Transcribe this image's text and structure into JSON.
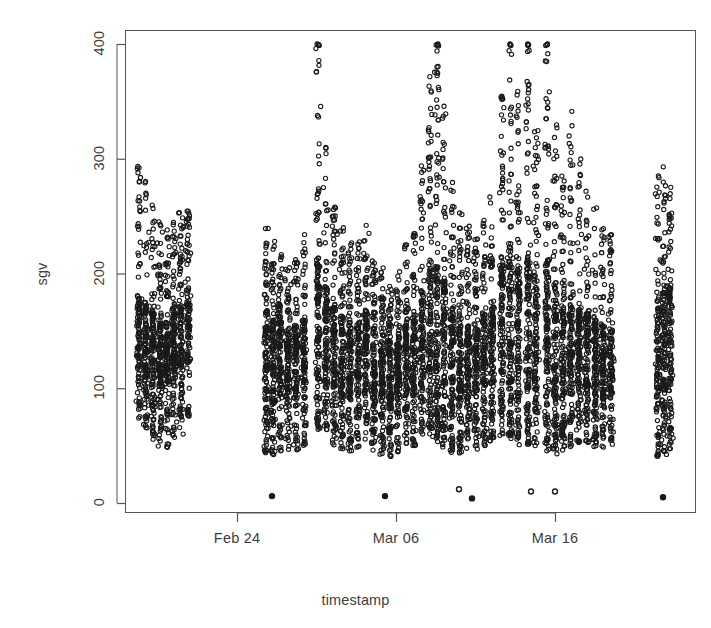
{
  "figure": {
    "background": "#ffffff",
    "ink_color": "#1a1a1a",
    "axis_color": "#555555",
    "point_symbol": "open-circle",
    "point_radius_px": 2.1,
    "point_stroke_px": 1.1
  },
  "axes": {
    "x_title": "timestamp",
    "y_title": "sgv",
    "x_ticks": [
      {
        "label": "Feb 24",
        "px": 237
      },
      {
        "label": "Mar 06",
        "px": 396
      },
      {
        "label": "Mar 16",
        "px": 555
      }
    ],
    "y_ticks": [
      {
        "label": "0",
        "value": 0
      },
      {
        "label": "100",
        "value": 100
      },
      {
        "label": "200",
        "value": 200
      },
      {
        "label": "300",
        "value": 300
      },
      {
        "label": "400",
        "value": 400
      }
    ],
    "plot_box_px": {
      "left": 125,
      "top": 30,
      "right": 695,
      "bottom": 512
    },
    "y_axis_px": {
      "v0": 503,
      "v400": 44
    },
    "box_drawn": true,
    "ticks_outward": true
  },
  "chart_data": {
    "type": "scatter",
    "title": "",
    "xlabel": "timestamp",
    "ylabel": "sgv",
    "ylim": [
      -12,
      412
    ],
    "xlim_days": [
      18.3,
      37.5
    ],
    "x_unit": "days since Feb 1 (Feb 24 = day 24, Mar 06 = day 34, Mar 16 = day 44 offset-mapped to pixels)",
    "grid": false,
    "legend": null,
    "value_ceiling": 400,
    "day_columns": [
      {
        "x_px": 139,
        "low": 72,
        "high": 300,
        "density": 120,
        "core_low": 118,
        "core_high": 182
      },
      {
        "x_px": 146,
        "low": 62,
        "high": 288,
        "density": 128,
        "core_low": 110,
        "core_high": 175
      },
      {
        "x_px": 153,
        "low": 55,
        "high": 262,
        "density": 130,
        "core_low": 105,
        "core_high": 168
      },
      {
        "x_px": 160,
        "low": 48,
        "high": 245,
        "density": 132,
        "core_low": 100,
        "core_high": 160
      },
      {
        "x_px": 167,
        "low": 45,
        "high": 238,
        "density": 126,
        "core_low": 104,
        "core_high": 158
      },
      {
        "x_px": 174,
        "low": 52,
        "high": 255,
        "density": 130,
        "core_low": 112,
        "core_high": 170
      },
      {
        "x_px": 181,
        "low": 60,
        "high": 262,
        "density": 124,
        "core_low": 118,
        "core_high": 176
      },
      {
        "x_px": 188,
        "low": 70,
        "high": 258,
        "density": 110,
        "core_low": 122,
        "core_high": 180
      },
      {
        "x_px": 266,
        "low": 42,
        "high": 240,
        "density": 122,
        "core_low": 92,
        "core_high": 168
      },
      {
        "x_px": 273,
        "low": 40,
        "high": 228,
        "density": 128,
        "core_low": 88,
        "core_high": 160
      },
      {
        "x_px": 280,
        "low": 44,
        "high": 218,
        "density": 126,
        "core_low": 95,
        "core_high": 158
      },
      {
        "x_px": 288,
        "low": 42,
        "high": 205,
        "density": 124,
        "core_low": 90,
        "core_high": 150
      },
      {
        "x_px": 296,
        "low": 46,
        "high": 212,
        "density": 120,
        "core_low": 98,
        "core_high": 155
      },
      {
        "x_px": 304,
        "low": 50,
        "high": 235,
        "density": 118,
        "core_low": 100,
        "core_high": 162
      },
      {
        "x_px": 318,
        "low": 62,
        "high": 400,
        "density": 138,
        "core_low": 110,
        "core_high": 215
      },
      {
        "x_px": 326,
        "low": 55,
        "high": 318,
        "density": 132,
        "core_low": 105,
        "core_high": 195
      },
      {
        "x_px": 334,
        "low": 50,
        "high": 262,
        "density": 128,
        "core_low": 100,
        "core_high": 175
      },
      {
        "x_px": 342,
        "low": 46,
        "high": 240,
        "density": 126,
        "core_low": 95,
        "core_high": 165
      },
      {
        "x_px": 350,
        "low": 44,
        "high": 228,
        "density": 124,
        "core_low": 92,
        "core_high": 158
      },
      {
        "x_px": 358,
        "low": 48,
        "high": 232,
        "density": 122,
        "core_low": 96,
        "core_high": 160
      },
      {
        "x_px": 366,
        "low": 52,
        "high": 245,
        "density": 120,
        "core_low": 100,
        "core_high": 168
      },
      {
        "x_px": 374,
        "low": 45,
        "high": 218,
        "density": 126,
        "core_low": 92,
        "core_high": 152
      },
      {
        "x_px": 382,
        "low": 42,
        "high": 208,
        "density": 128,
        "core_low": 88,
        "core_high": 148
      },
      {
        "x_px": 390,
        "low": 40,
        "high": 198,
        "density": 130,
        "core_low": 85,
        "core_high": 142
      },
      {
        "x_px": 398,
        "low": 44,
        "high": 205,
        "density": 126,
        "core_low": 90,
        "core_high": 148
      },
      {
        "x_px": 406,
        "low": 48,
        "high": 225,
        "density": 122,
        "core_low": 95,
        "core_high": 158
      },
      {
        "x_px": 414,
        "low": 50,
        "high": 238,
        "density": 124,
        "core_low": 98,
        "core_high": 165
      },
      {
        "x_px": 422,
        "low": 55,
        "high": 300,
        "density": 128,
        "core_low": 102,
        "core_high": 185
      },
      {
        "x_px": 430,
        "low": 58,
        "high": 372,
        "density": 134,
        "core_low": 108,
        "core_high": 212
      },
      {
        "x_px": 437,
        "low": 52,
        "high": 400,
        "density": 140,
        "core_low": 102,
        "core_high": 208
      },
      {
        "x_px": 444,
        "low": 48,
        "high": 352,
        "density": 134,
        "core_low": 98,
        "core_high": 196
      },
      {
        "x_px": 452,
        "low": 44,
        "high": 288,
        "density": 130,
        "core_low": 92,
        "core_high": 172
      },
      {
        "x_px": 460,
        "low": 42,
        "high": 258,
        "density": 128,
        "core_low": 88,
        "core_high": 160
      },
      {
        "x_px": 468,
        "low": 45,
        "high": 242,
        "density": 126,
        "core_low": 92,
        "core_high": 155
      },
      {
        "x_px": 476,
        "low": 46,
        "high": 230,
        "density": 124,
        "core_low": 95,
        "core_high": 152
      },
      {
        "x_px": 484,
        "low": 50,
        "high": 248,
        "density": 122,
        "core_low": 100,
        "core_high": 165
      },
      {
        "x_px": 492,
        "low": 54,
        "high": 268,
        "density": 126,
        "core_low": 104,
        "core_high": 175
      },
      {
        "x_px": 502,
        "low": 58,
        "high": 378,
        "density": 136,
        "core_low": 108,
        "core_high": 215
      },
      {
        "x_px": 510,
        "low": 55,
        "high": 400,
        "density": 142,
        "core_low": 105,
        "core_high": 225
      },
      {
        "x_px": 518,
        "low": 50,
        "high": 362,
        "density": 138,
        "core_low": 100,
        "core_high": 205
      },
      {
        "x_px": 528,
        "low": 48,
        "high": 400,
        "density": 140,
        "core_low": 98,
        "core_high": 218
      },
      {
        "x_px": 536,
        "low": 46,
        "high": 345,
        "density": 134,
        "core_low": 95,
        "core_high": 198
      },
      {
        "x_px": 547,
        "low": 44,
        "high": 400,
        "density": 142,
        "core_low": 92,
        "core_high": 212
      },
      {
        "x_px": 555,
        "low": 42,
        "high": 330,
        "density": 136,
        "core_low": 90,
        "core_high": 188
      },
      {
        "x_px": 563,
        "low": 45,
        "high": 290,
        "density": 132,
        "core_low": 92,
        "core_high": 172
      },
      {
        "x_px": 571,
        "low": 48,
        "high": 342,
        "density": 130,
        "core_low": 96,
        "core_high": 185
      },
      {
        "x_px": 579,
        "low": 50,
        "high": 300,
        "density": 128,
        "core_low": 98,
        "core_high": 175
      },
      {
        "x_px": 587,
        "low": 52,
        "high": 272,
        "density": 126,
        "core_low": 100,
        "core_high": 168
      },
      {
        "x_px": 595,
        "low": 48,
        "high": 258,
        "density": 124,
        "core_low": 95,
        "core_high": 160
      },
      {
        "x_px": 603,
        "low": 46,
        "high": 245,
        "density": 122,
        "core_low": 92,
        "core_high": 155
      },
      {
        "x_px": 611,
        "low": 50,
        "high": 238,
        "density": 118,
        "core_low": 96,
        "core_high": 152
      },
      {
        "x_px": 658,
        "low": 40,
        "high": 288,
        "density": 120,
        "core_low": 92,
        "core_high": 182
      },
      {
        "x_px": 664,
        "low": 42,
        "high": 295,
        "density": 126,
        "core_low": 95,
        "core_high": 190
      },
      {
        "x_px": 670,
        "low": 44,
        "high": 282,
        "density": 122,
        "core_low": 98,
        "core_high": 185
      }
    ],
    "near_zero_points": [
      {
        "x_px": 272,
        "value": 6
      },
      {
        "x_px": 385,
        "value": 6
      },
      {
        "x_px": 459,
        "value": 12
      },
      {
        "x_px": 472,
        "value": 4
      },
      {
        "x_px": 531,
        "value": 10
      },
      {
        "x_px": 555,
        "value": 10
      },
      {
        "x_px": 663,
        "value": 5
      }
    ]
  }
}
